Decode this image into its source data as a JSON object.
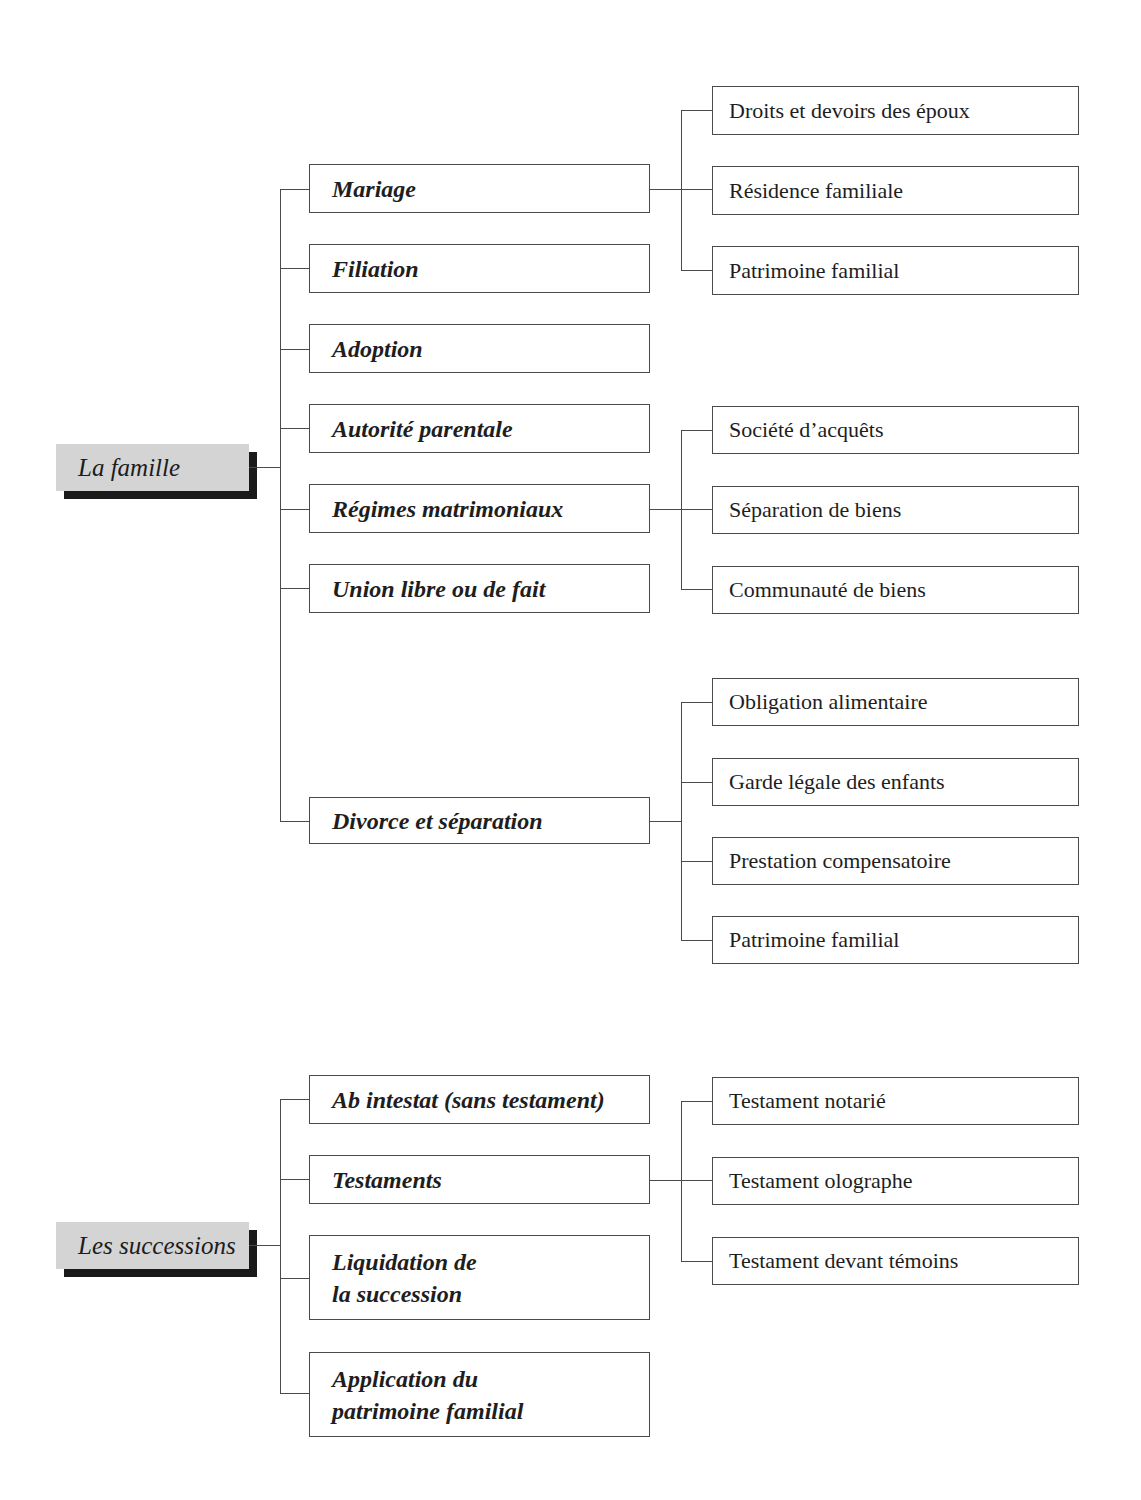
{
  "sections": [
    {
      "title": "La famille",
      "children": [
        {
          "label": "Mariage",
          "children": [
            "Droits et devoirs des époux",
            "Résidence familiale",
            "Patrimoine familial"
          ]
        },
        {
          "label": "Filiation",
          "children": []
        },
        {
          "label": "Adoption",
          "children": []
        },
        {
          "label": "Autorité parentale",
          "children": []
        },
        {
          "label": "Régimes matrimoniaux",
          "children": [
            "Société d’acquêts",
            "Séparation de biens",
            "Communauté de biens"
          ]
        },
        {
          "label": "Union libre ou de fait",
          "children": []
        },
        {
          "label": "Divorce et séparation",
          "children": [
            "Obligation alimentaire",
            "Garde légale des enfants",
            "Prestation compensatoire",
            "Patrimoine familial"
          ]
        }
      ]
    },
    {
      "title": "Les successions",
      "children": [
        {
          "label": "Ab intestat (sans testament)",
          "children": []
        },
        {
          "label": "Testaments",
          "children": [
            "Testament notarié",
            "Testament olographe",
            "Testament devant témoins"
          ]
        },
        {
          "label": "Liquidation de la succession",
          "lines": [
            "Liquidation de",
            "la succession"
          ],
          "children": []
        },
        {
          "label": "Application du patrimoine familial",
          "lines": [
            "Application du",
            "patrimoine familial"
          ],
          "children": []
        }
      ]
    }
  ],
  "colors": {
    "root_fill": "#d4d4d4",
    "root_shadow": "#1a1a1a",
    "line": "#4a4a4a",
    "text": "#1e1e1e"
  }
}
